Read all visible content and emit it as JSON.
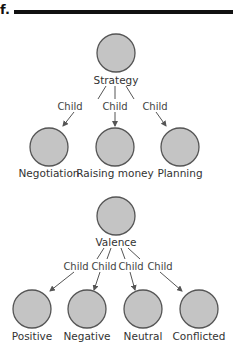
{
  "figure": {
    "label": "f."
  },
  "trees": [
    {
      "root": {
        "label": "Strategy",
        "cx": 116,
        "cy": 53
      },
      "edge_label": "Child",
      "children": [
        {
          "label": "Negotiation",
          "cx": 49,
          "cy": 147
        },
        {
          "label": "Raising money",
          "cx": 115,
          "cy": 147
        },
        {
          "label": "Planning",
          "cx": 180,
          "cy": 147
        }
      ]
    },
    {
      "root": {
        "label": "Valence",
        "cx": 116,
        "cy": 216
      },
      "edge_label": "Child",
      "children": [
        {
          "label": "Positive",
          "cx": 32,
          "cy": 309
        },
        {
          "label": "Negative",
          "cx": 87,
          "cy": 309
        },
        {
          "label": "Neutral",
          "cx": 143,
          "cy": 309
        },
        {
          "label": "Conflicted",
          "cx": 199,
          "cy": 309
        }
      ]
    }
  ],
  "colors": {
    "node_fill": "#c4c4c4",
    "node_stroke": "#555555",
    "edge": "#555555",
    "bar": "#111111"
  }
}
